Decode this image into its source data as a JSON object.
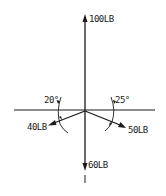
{
  "diagram": {
    "origin": {
      "x": 85,
      "y": 111
    },
    "horizontal_axis": {
      "x1": 14,
      "x2": 155,
      "y": 110
    },
    "forces": [
      {
        "id": "f100",
        "label": "100LB",
        "magnitude": 100,
        "unit": "LB",
        "direction": "up",
        "angle_deg": 90
      },
      {
        "id": "f60",
        "label": "60LB",
        "magnitude": 60,
        "unit": "LB",
        "direction": "down",
        "angle_deg": 270
      },
      {
        "id": "f40",
        "label": "40LB",
        "magnitude": 40,
        "unit": "LB",
        "direction": "left-down",
        "angle_from_horizontal_deg": 20
      },
      {
        "id": "f50",
        "label": "50LB",
        "magnitude": 50,
        "unit": "LB",
        "direction": "right-down",
        "angle_from_horizontal_deg": 25
      }
    ],
    "angles": [
      {
        "id": "a20",
        "label": "20°",
        "side": "left"
      },
      {
        "id": "a25",
        "label": "25°",
        "side": "right"
      }
    ],
    "colors": {
      "ink": "#1a1a1a",
      "background": "#ffffff"
    }
  }
}
